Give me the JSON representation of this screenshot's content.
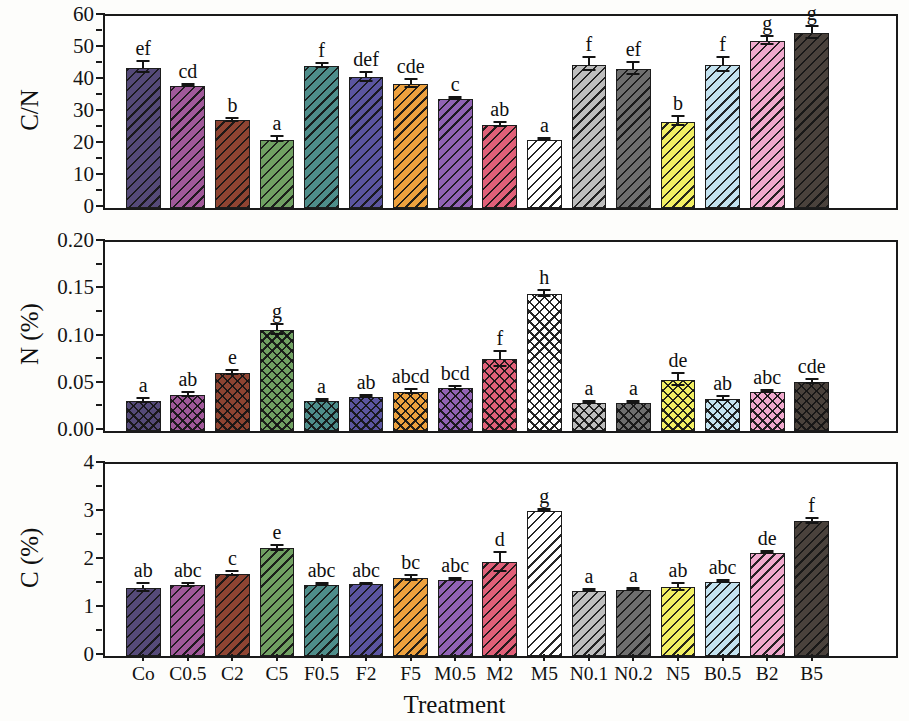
{
  "figure": {
    "xlabel": "Treatment",
    "categories": [
      "Co",
      "C0.5",
      "C2",
      "C5",
      "F0.5",
      "F2",
      "F5",
      "M0.5",
      "M2",
      "M5",
      "N0.1",
      "N0.2",
      "N5",
      "B0.5",
      "B2",
      "B5"
    ],
    "colors": [
      "#554a78",
      "#a0599a",
      "#8e4432",
      "#70a062",
      "#4e8d8a",
      "#5b55a0",
      "#eda13e",
      "#9163b4",
      "#e06078",
      "#ffffff",
      "#bdbdbd",
      "#6e6e6e",
      "#f2ef63",
      "#c3e2ef",
      "#f0a9cd",
      "#4a423c"
    ]
  },
  "chart_data": [
    {
      "type": "bar",
      "title": "C/N",
      "ylabel": "C/N",
      "xlabel": "Treatment",
      "ylim": [
        0,
        60
      ],
      "yticks": [
        "0",
        "10",
        "20",
        "30",
        "40",
        "50",
        "60"
      ],
      "grid": false,
      "hatch": "diagonal",
      "categories": [
        "Co",
        "C0.5",
        "C2",
        "C5",
        "F0.5",
        "F2",
        "F5",
        "M0.5",
        "M2",
        "M5",
        "N0.1",
        "N0.2",
        "N5",
        "B0.5",
        "B2",
        "B5"
      ],
      "values": [
        43.8,
        38.1,
        27.4,
        21.3,
        44.4,
        40.8,
        38.7,
        34.2,
        25.9,
        21.2,
        44.8,
        43.4,
        27.0,
        44.8,
        52.2,
        54.6
      ],
      "errors": [
        1.7,
        0.4,
        0.4,
        0.8,
        0.5,
        1.4,
        1.3,
        0.3,
        0.7,
        0.3,
        2.1,
        1.8,
        1.4,
        2.2,
        1.3,
        1.9
      ],
      "sig_labels": [
        "ef",
        "cd",
        "b",
        "a",
        "f",
        "def",
        "cde",
        "c",
        "ab",
        "a",
        "f",
        "ef",
        "b",
        "f",
        "g",
        "g"
      ]
    },
    {
      "type": "bar",
      "title": "N (%)",
      "ylabel": "N (%)",
      "xlabel": "Treatment",
      "ylim": [
        0,
        0.2
      ],
      "yticks": [
        "0.00",
        "0.05",
        "0.10",
        "0.15",
        "0.20"
      ],
      "grid": false,
      "hatch": "crosshatch",
      "categories": [
        "Co",
        "C0.5",
        "C2",
        "C5",
        "F0.5",
        "F2",
        "F5",
        "M0.5",
        "M2",
        "M5",
        "N0.1",
        "N0.2",
        "N5",
        "B0.5",
        "B2",
        "B5"
      ],
      "values": [
        0.032,
        0.038,
        0.061,
        0.107,
        0.032,
        0.036,
        0.041,
        0.045,
        0.076,
        0.145,
        0.03,
        0.03,
        0.054,
        0.034,
        0.041,
        0.052
      ],
      "errors": [
        0.002,
        0.002,
        0.002,
        0.005,
        0.001,
        0.001,
        0.002,
        0.002,
        0.008,
        0.003,
        0.001,
        0.001,
        0.006,
        0.002,
        0.001,
        0.002
      ],
      "sig_labels": [
        "a",
        "ab",
        "e",
        "g",
        "a",
        "ab",
        "abcd",
        "bcd",
        "f",
        "h",
        "a",
        "a",
        "de",
        "ab",
        "abc",
        "cde"
      ]
    },
    {
      "type": "bar",
      "title": "C (%)",
      "ylabel": "C (%)",
      "xlabel": "Treatment",
      "ylim": [
        0,
        4
      ],
      "yticks": [
        "0",
        "1",
        "2",
        "3",
        "4"
      ],
      "grid": false,
      "hatch": "diagonal",
      "categories": [
        "Co",
        "C0.5",
        "C2",
        "C5",
        "F0.5",
        "F2",
        "F5",
        "M0.5",
        "M2",
        "M5",
        "N0.1",
        "N0.2",
        "N5",
        "B0.5",
        "B2",
        "B5"
      ],
      "values": [
        1.41,
        1.47,
        1.7,
        2.24,
        1.47,
        1.49,
        1.62,
        1.58,
        1.95,
        3.03,
        1.35,
        1.37,
        1.43,
        1.55,
        2.15,
        2.81
      ],
      "errors": [
        0.08,
        0.03,
        0.04,
        0.05,
        0.02,
        0.02,
        0.05,
        0.02,
        0.2,
        0.02,
        0.02,
        0.02,
        0.08,
        0.02,
        0.02,
        0.05
      ],
      "sig_labels": [
        "ab",
        "abc",
        "c",
        "e",
        "abc",
        "abc",
        "bc",
        "abc",
        "d",
        "g",
        "a",
        "a",
        "ab",
        "abc",
        "de",
        "f"
      ]
    }
  ]
}
